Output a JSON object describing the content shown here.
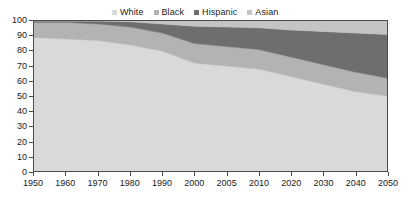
{
  "chart_data": {
    "type": "area",
    "title": "",
    "subtitle": "",
    "xlabel": "",
    "ylabel": "",
    "stacked": true,
    "grid": false,
    "legend_position": "top-center",
    "ylim": [
      0,
      100
    ],
    "ytick_labels": [
      "0",
      "10",
      "20",
      "30",
      "40",
      "50",
      "60",
      "70",
      "80",
      "90",
      "100"
    ],
    "yticks": [
      0,
      10,
      20,
      30,
      40,
      50,
      60,
      70,
      80,
      90,
      100
    ],
    "categories": [
      "1950",
      "1960",
      "1970",
      "1980",
      "1990",
      "2000",
      "2005",
      "2010",
      "2020",
      "2030",
      "2040",
      "2050"
    ],
    "x": [
      1950,
      1960,
      1970,
      1980,
      1990,
      2000,
      2005,
      2010,
      2020,
      2030,
      2040,
      2050
    ],
    "series": [
      {
        "name": "White",
        "color": "#d9d9d9",
        "values": [
          89,
          88,
          87,
          84,
          80,
          72,
          70,
          68,
          63,
          58,
          53,
          50
        ]
      },
      {
        "name": "Black",
        "color": "#b3b3b3",
        "values": [
          10,
          11,
          11,
          12,
          12,
          13,
          13,
          13,
          13,
          13,
          13,
          12
        ]
      },
      {
        "name": "Hispanic",
        "color": "#6e6e6e",
        "values": [
          1,
          1,
          2,
          3.5,
          6,
          11.5,
          13,
          14.5,
          18,
          22,
          26,
          29
        ]
      },
      {
        "name": "Asian",
        "color": "#c4c4c4",
        "values": [
          0,
          0,
          0,
          0.5,
          2,
          3.5,
          4,
          4.5,
          6,
          7,
          8,
          9
        ]
      }
    ],
    "cumulative_tops": {
      "White": [
        89,
        88,
        87,
        84,
        80,
        72,
        70,
        68,
        63,
        58,
        53,
        50
      ],
      "Black": [
        99,
        99,
        98,
        96,
        92,
        85,
        83,
        81,
        76,
        71,
        66,
        62
      ],
      "Hispanic": [
        100,
        100,
        100,
        99.5,
        98,
        96.5,
        96,
        95.5,
        94,
        93,
        92,
        91
      ],
      "Asian": [
        100,
        100,
        100,
        100,
        100,
        100,
        100,
        100,
        100,
        100,
        100,
        100
      ]
    }
  },
  "legend": {
    "items": [
      {
        "label": "White",
        "color": "#d9d9d9"
      },
      {
        "label": "Black",
        "color": "#b3b3b3"
      },
      {
        "label": "Hispanic",
        "color": "#6e6e6e"
      },
      {
        "label": "Asian",
        "color": "#c4c4c4"
      }
    ]
  },
  "axes": {
    "frame_color": "#4a4a4a",
    "tick_color": "#4a4a4a",
    "text_color": "#1a1a1a"
  }
}
